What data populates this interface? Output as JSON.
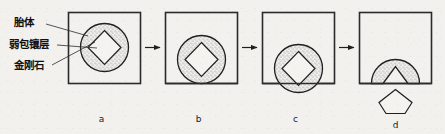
{
  "figure": {
    "background_color": "#f2f1ee",
    "line_color": "#1f1f1f"
  },
  "annotations": {
    "items": [
      {
        "id": "matrix",
        "label": "胎体",
        "meaning": "matrix-body"
      },
      {
        "id": "weaklayer",
        "label": "弱包镶层",
        "meaning": "weak-embedding-layer"
      },
      {
        "id": "diamond",
        "label": "金刚石",
        "meaning": "diamond-grit"
      }
    ]
  },
  "panels": [
    {
      "id": "a",
      "caption": "a",
      "state": "diamond fully embedded, circle centred in matrix"
    },
    {
      "id": "b",
      "caption": "b",
      "state": "circle shifted down, touching matrix bottom edge"
    },
    {
      "id": "c",
      "caption": "c",
      "state": "circle protruding below matrix bottom edge"
    },
    {
      "id": "d",
      "caption": "d",
      "state": "diamond dislodged, cavity left in weak layer"
    }
  ],
  "arrows": {
    "count": 3,
    "direction": "right",
    "glyph": "arrow-right"
  },
  "colors": {
    "stipple": "#9a9a9a",
    "outline": "#1f1f1f",
    "paper": "#f2f1ee",
    "diamond_fill": "#f4f3f0"
  }
}
